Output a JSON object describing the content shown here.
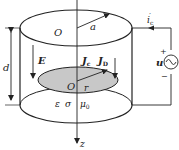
{
  "diagram": {
    "type": "cylindrical capacitor with AC source",
    "labels": {
      "center_top": "O",
      "radius_top": "a",
      "height": "d",
      "field": "E",
      "conduction_current_density": "J",
      "conduction_sub": "c",
      "displacement_current_density": "J",
      "displacement_sub": "D",
      "center_disk": "O",
      "radius_disk": "r",
      "permittivity": "ε",
      "conductivity": "σ",
      "permeability": "μ",
      "permeability_sub": "0",
      "axis": "z",
      "current": "i",
      "current_sub": "c",
      "current_prime": "′",
      "source": "u",
      "plus": "+",
      "minus": "−"
    },
    "colors": {
      "stroke": "#222222",
      "disk_fill": "#c8c8c8",
      "background": "#ffffff"
    }
  }
}
